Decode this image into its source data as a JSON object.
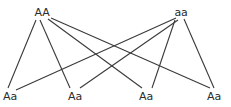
{
  "diagram": {
    "type": "genetic-cross",
    "line_color": "#3a3a3a",
    "parents": [
      {
        "id": "p1",
        "label": "AA",
        "x": 42,
        "y": 7
      },
      {
        "id": "p2",
        "label": "aa",
        "x": 181,
        "y": 7
      }
    ],
    "offspring": [
      {
        "id": "o1",
        "label": "Aa",
        "x": 10,
        "y": 91
      },
      {
        "id": "o2",
        "label": "Aa",
        "x": 75,
        "y": 91
      },
      {
        "id": "o3",
        "label": "Aa",
        "x": 146,
        "y": 91
      },
      {
        "id": "o4",
        "label": "Aa",
        "x": 214,
        "y": 91
      }
    ],
    "edges": [
      {
        "from": "p1",
        "to": "o1",
        "x1": 36,
        "y1": 20,
        "x2": 8,
        "y2": 88
      },
      {
        "from": "p1",
        "to": "o2",
        "x1": 40,
        "y1": 20,
        "x2": 70,
        "y2": 88
      },
      {
        "from": "p1",
        "to": "o3",
        "x1": 48,
        "y1": 19,
        "x2": 142,
        "y2": 88
      },
      {
        "from": "p1",
        "to": "o4",
        "x1": 51,
        "y1": 18,
        "x2": 210,
        "y2": 88
      },
      {
        "from": "p2",
        "to": "o1",
        "x1": 176,
        "y1": 18,
        "x2": 16,
        "y2": 90
      },
      {
        "from": "p2",
        "to": "o2",
        "x1": 178,
        "y1": 20,
        "x2": 80,
        "y2": 88
      },
      {
        "from": "p2",
        "to": "o3",
        "x1": 175,
        "y1": 20,
        "x2": 152,
        "y2": 88
      },
      {
        "from": "p2",
        "to": "o4",
        "x1": 184,
        "y1": 19,
        "x2": 214,
        "y2": 88
      }
    ]
  }
}
